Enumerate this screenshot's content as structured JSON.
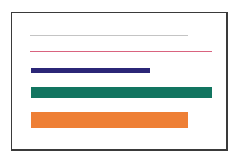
{
  "figure": {
    "frame_color": "#3a3a3a",
    "background": "#ffffff",
    "lines": [
      {
        "name": "thin-gray-line",
        "color": "#c4c4c4",
        "x": 30,
        "y": 35,
        "width": 158,
        "height": 1
      },
      {
        "name": "thin-pink-line",
        "color": "#d9637f",
        "x": 30,
        "y": 51,
        "width": 182,
        "height": 1
      },
      {
        "name": "navy-bar",
        "color": "#2b2677",
        "x": 31,
        "y": 68,
        "width": 119,
        "height": 5
      },
      {
        "name": "green-bar",
        "color": "#127560",
        "x": 31,
        "y": 87,
        "width": 181,
        "height": 11
      },
      {
        "name": "orange-bar",
        "color": "#ee7f35",
        "x": 31,
        "y": 112,
        "width": 157,
        "height": 16
      }
    ]
  }
}
